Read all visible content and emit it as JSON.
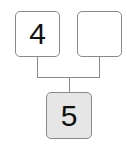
{
  "diagram": {
    "top_left_box": {
      "value": "4"
    },
    "top_right_box": {
      "value": ""
    },
    "bottom_box": {
      "value": "5"
    },
    "colors": {
      "border": "#8a8a8a",
      "bottom_fill": "#e6e6e6"
    }
  }
}
